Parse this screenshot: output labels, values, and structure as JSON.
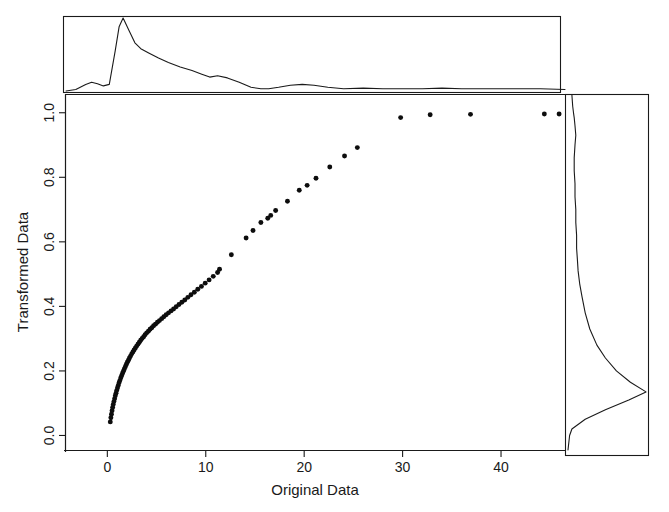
{
  "chart_data": {
    "type": "scatter",
    "title": "",
    "xlabel": "Original Data",
    "ylabel": "Transformed Data",
    "xlim": [
      -4.2,
      46.5
    ],
    "ylim": [
      -0.045,
      1.055
    ],
    "xticks": [
      0,
      10,
      20,
      30,
      40
    ],
    "xticklabels": [
      "0",
      "10",
      "20",
      "30",
      "40"
    ],
    "yticks": [
      0.0,
      0.2,
      0.4,
      0.6,
      0.8,
      1.0
    ],
    "yticklabels": [
      "0.0",
      "0.2",
      "0.4",
      "0.6",
      "0.8",
      "1.0"
    ],
    "grid": false,
    "legend": null,
    "marker": "filled-circle",
    "marker_color": "#0d0d0d",
    "points": [
      {
        "x": 0.3,
        "y": 0.042
      },
      {
        "x": 0.36,
        "y": 0.055
      },
      {
        "x": 0.42,
        "y": 0.066
      },
      {
        "x": 0.48,
        "y": 0.077
      },
      {
        "x": 0.54,
        "y": 0.087
      },
      {
        "x": 0.6,
        "y": 0.096
      },
      {
        "x": 0.67,
        "y": 0.105
      },
      {
        "x": 0.74,
        "y": 0.114
      },
      {
        "x": 0.81,
        "y": 0.123
      },
      {
        "x": 0.88,
        "y": 0.131
      },
      {
        "x": 0.95,
        "y": 0.139
      },
      {
        "x": 1.03,
        "y": 0.147
      },
      {
        "x": 1.11,
        "y": 0.155
      },
      {
        "x": 1.19,
        "y": 0.163
      },
      {
        "x": 1.27,
        "y": 0.17
      },
      {
        "x": 1.36,
        "y": 0.178
      },
      {
        "x": 1.45,
        "y": 0.185
      },
      {
        "x": 1.54,
        "y": 0.192
      },
      {
        "x": 1.63,
        "y": 0.199
      },
      {
        "x": 1.73,
        "y": 0.206
      },
      {
        "x": 1.83,
        "y": 0.213
      },
      {
        "x": 1.93,
        "y": 0.22
      },
      {
        "x": 2.03,
        "y": 0.227
      },
      {
        "x": 2.14,
        "y": 0.233
      },
      {
        "x": 2.25,
        "y": 0.24
      },
      {
        "x": 2.36,
        "y": 0.246
      },
      {
        "x": 2.48,
        "y": 0.253
      },
      {
        "x": 2.6,
        "y": 0.259
      },
      {
        "x": 2.72,
        "y": 0.265
      },
      {
        "x": 2.85,
        "y": 0.271
      },
      {
        "x": 2.98,
        "y": 0.277
      },
      {
        "x": 3.11,
        "y": 0.283
      },
      {
        "x": 3.25,
        "y": 0.289
      },
      {
        "x": 3.39,
        "y": 0.295
      },
      {
        "x": 3.54,
        "y": 0.301
      },
      {
        "x": 3.69,
        "y": 0.306
      },
      {
        "x": 3.84,
        "y": 0.312
      },
      {
        "x": 4.0,
        "y": 0.318
      },
      {
        "x": 4.17,
        "y": 0.323
      },
      {
        "x": 4.34,
        "y": 0.329
      },
      {
        "x": 4.52,
        "y": 0.334
      },
      {
        "x": 4.7,
        "y": 0.34
      },
      {
        "x": 4.89,
        "y": 0.345
      },
      {
        "x": 5.09,
        "y": 0.351
      },
      {
        "x": 5.3,
        "y": 0.356
      },
      {
        "x": 5.52,
        "y": 0.362
      },
      {
        "x": 5.74,
        "y": 0.368
      },
      {
        "x": 5.98,
        "y": 0.374
      },
      {
        "x": 6.22,
        "y": 0.38
      },
      {
        "x": 6.47,
        "y": 0.386
      },
      {
        "x": 6.73,
        "y": 0.392
      },
      {
        "x": 7.0,
        "y": 0.399
      },
      {
        "x": 7.28,
        "y": 0.406
      },
      {
        "x": 7.57,
        "y": 0.413
      },
      {
        "x": 7.87,
        "y": 0.42
      },
      {
        "x": 8.18,
        "y": 0.428
      },
      {
        "x": 8.5,
        "y": 0.436
      },
      {
        "x": 8.84,
        "y": 0.444
      },
      {
        "x": 9.19,
        "y": 0.453
      },
      {
        "x": 9.56,
        "y": 0.462
      },
      {
        "x": 9.94,
        "y": 0.472
      },
      {
        "x": 10.34,
        "y": 0.482
      },
      {
        "x": 10.76,
        "y": 0.493
      },
      {
        "x": 11.2,
        "y": 0.505
      },
      {
        "x": 11.4,
        "y": 0.515
      },
      {
        "x": 12.6,
        "y": 0.56
      },
      {
        "x": 14.1,
        "y": 0.612
      },
      {
        "x": 14.8,
        "y": 0.635
      },
      {
        "x": 15.6,
        "y": 0.66
      },
      {
        "x": 16.3,
        "y": 0.673
      },
      {
        "x": 16.6,
        "y": 0.682
      },
      {
        "x": 17.1,
        "y": 0.697
      },
      {
        "x": 18.3,
        "y": 0.726
      },
      {
        "x": 19.5,
        "y": 0.76
      },
      {
        "x": 20.3,
        "y": 0.775
      },
      {
        "x": 21.2,
        "y": 0.797
      },
      {
        "x": 22.6,
        "y": 0.832
      },
      {
        "x": 24.1,
        "y": 0.866
      },
      {
        "x": 25.4,
        "y": 0.892
      },
      {
        "x": 29.8,
        "y": 0.985
      },
      {
        "x": 32.8,
        "y": 0.994
      },
      {
        "x": 36.9,
        "y": 0.995
      },
      {
        "x": 44.4,
        "y": 0.996
      },
      {
        "x": 45.9,
        "y": 0.996
      }
    ],
    "top_marginal": {
      "type": "density",
      "axis": "x",
      "description": "Right-skewed kernel density of Original Data, sharp mode near x=1.6",
      "x": [
        -4.2,
        -3.2,
        -2.2,
        -1.6,
        -1.0,
        -0.4,
        0.2,
        0.8,
        1.2,
        1.6,
        2.2,
        2.8,
        3.4,
        4.2,
        5.2,
        6.2,
        7.4,
        8.6,
        9.6,
        10.4,
        11.2,
        12.2,
        13.4,
        14.6,
        15.6,
        16.4,
        17.4,
        18.6,
        19.8,
        21.0,
        22.4,
        24.0,
        26.0,
        28.0,
        30.0,
        32.0,
        34.0,
        36.0,
        38.0,
        40.0,
        42.0,
        44.0,
        46.5
      ],
      "y": [
        0.0,
        0.02,
        0.09,
        0.12,
        0.1,
        0.07,
        0.09,
        0.55,
        0.88,
        1.0,
        0.83,
        0.66,
        0.58,
        0.52,
        0.45,
        0.39,
        0.33,
        0.28,
        0.23,
        0.19,
        0.21,
        0.18,
        0.12,
        0.05,
        0.03,
        0.03,
        0.05,
        0.08,
        0.09,
        0.08,
        0.05,
        0.03,
        0.04,
        0.03,
        0.03,
        0.03,
        0.04,
        0.03,
        0.03,
        0.03,
        0.03,
        0.03,
        0.02
      ]
    },
    "right_marginal": {
      "type": "density",
      "axis": "y",
      "description": "Kernel density of Transformed Data, dominant mode near y=0.135",
      "y": [
        -0.045,
        0.0,
        0.02,
        0.05,
        0.08,
        0.11,
        0.135,
        0.165,
        0.2,
        0.24,
        0.28,
        0.33,
        0.38,
        0.43,
        0.47,
        0.51,
        0.545,
        0.58,
        0.62,
        0.66,
        0.7,
        0.74,
        0.78,
        0.82,
        0.86,
        0.9,
        0.93,
        0.96,
        0.985,
        1.0,
        1.02,
        1.055
      ],
      "x": [
        0.0,
        0.02,
        0.05,
        0.22,
        0.48,
        0.78,
        1.0,
        0.8,
        0.62,
        0.48,
        0.37,
        0.28,
        0.22,
        0.18,
        0.15,
        0.13,
        0.12,
        0.11,
        0.11,
        0.1,
        0.1,
        0.09,
        0.09,
        0.08,
        0.08,
        0.09,
        0.1,
        0.09,
        0.08,
        0.07,
        0.06,
        0.05
      ]
    }
  }
}
